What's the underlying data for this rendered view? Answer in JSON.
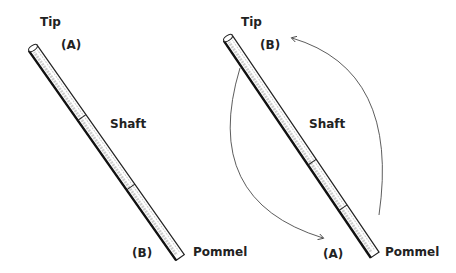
{
  "left": {
    "tip": "Tip",
    "end_top": "(A)",
    "shaft": "Shaft",
    "end_bottom": "(B)",
    "pommel": "Pommel"
  },
  "right": {
    "tip": "Tip",
    "end_top": "(B)",
    "shaft": "Shaft",
    "end_bottom": "(A)",
    "pommel": "Pommel"
  },
  "colors": {
    "ink": "#222222",
    "background": "#ffffff"
  }
}
